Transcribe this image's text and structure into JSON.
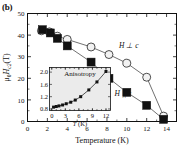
{
  "panel": {
    "label": "(b)"
  },
  "chart_data": {
    "type": "scatter",
    "title": "",
    "xlabel": "Temperature (K)",
    "ylabel": "μ₀H_c2 (T)",
    "xlim": [
      0,
      15
    ],
    "ylim": [
      0,
      50
    ],
    "xticks": [
      0,
      2,
      4,
      6,
      8,
      10,
      12,
      14
    ],
    "yticks": [
      0,
      10,
      20,
      30,
      40,
      50
    ],
    "grid": false,
    "legend_position": "inline-annotations",
    "series": [
      {
        "name": "H ⊥ c",
        "marker": "open-circle",
        "x": [
          1.4,
          2.2,
          3.0,
          4.0,
          6.4,
          8.2,
          10.0,
          12.0,
          13.7
        ],
        "y": [
          42.0,
          41.5,
          39.5,
          38.0,
          34.5,
          31.0,
          27.0,
          20.5,
          2.5
        ]
      },
      {
        "name": "H || c",
        "marker": "filled-square",
        "x": [
          1.5,
          2.3,
          3.0,
          4.0,
          6.4,
          8.2,
          10.0,
          12.0,
          13.7
        ],
        "y": [
          42.5,
          41.0,
          38.5,
          35.0,
          27.5,
          20.0,
          13.5,
          7.5,
          1.0
        ]
      }
    ],
    "annotations": [
      {
        "text": "H ⊥ c",
        "x": 10.2,
        "y": 34.0
      },
      {
        "text": "H || c",
        "x": 9.6,
        "y": 12.0
      }
    ],
    "inset": {
      "type": "line",
      "title": "Anisotropy",
      "xlabel": "T (K)",
      "ylabel": "",
      "xlim": [
        -0.5,
        13.0
      ],
      "ylim": [
        0.75,
        2.15
      ],
      "xticks": [
        0,
        3,
        6,
        9,
        12
      ],
      "yticks": [
        0.8,
        1.2,
        1.6,
        2.0
      ],
      "x": [
        0.4,
        1.0,
        1.6,
        2.4,
        3.2,
        4.2,
        5.2,
        6.4,
        8.2,
        10.0,
        12.0
      ],
      "y": [
        0.86,
        0.88,
        0.9,
        0.93,
        0.97,
        1.02,
        1.09,
        1.2,
        1.42,
        1.68,
        2.02
      ]
    }
  }
}
